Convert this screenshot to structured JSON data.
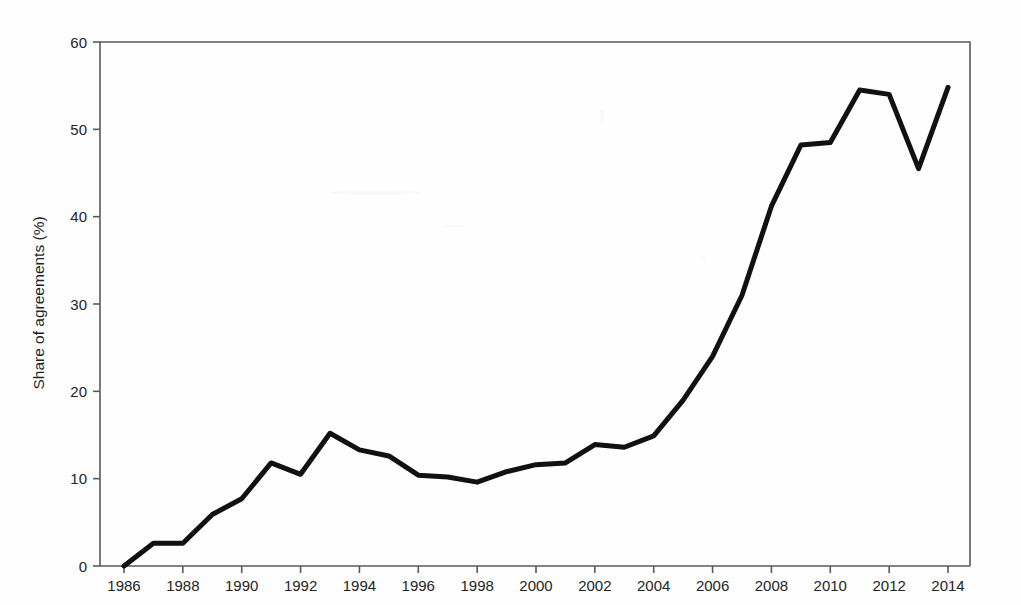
{
  "chart_data": {
    "type": "line",
    "title": "",
    "subtitle": "",
    "xlabel": "",
    "ylabel": "Share of agreements (%)",
    "xlim": [
      1985.5,
      2014.6
    ],
    "ylim": [
      0,
      60
    ],
    "xticks": [
      1986,
      1988,
      1990,
      1992,
      1994,
      1996,
      1998,
      2000,
      2002,
      2004,
      2006,
      2008,
      2010,
      2012,
      2014
    ],
    "xtick_labels": [
      "1986",
      "1988",
      "1990",
      "1992",
      "1994",
      "1996",
      "1998",
      "2000",
      "2002",
      "2004",
      "2006",
      "2008",
      "2010",
      "2012",
      "2014"
    ],
    "yticks": [
      0,
      10,
      20,
      30,
      40,
      50,
      60
    ],
    "ytick_labels": [
      "0",
      "10",
      "20",
      "30",
      "40",
      "50",
      "60"
    ],
    "grid": false,
    "legend": false,
    "legend_position": "none",
    "line_color": "#111111",
    "line_width": 5,
    "x": [
      1986,
      1987,
      1988,
      1989,
      1990,
      1991,
      1992,
      1993,
      1994,
      1995,
      1996,
      1997,
      1998,
      1999,
      2000,
      2001,
      2002,
      2003,
      2004,
      2005,
      2006,
      2007,
      2008,
      2009,
      2010,
      2011,
      2012,
      2013,
      2014
    ],
    "series": [
      {
        "name": "Share of agreements",
        "values": [
          0.0,
          2.6,
          2.6,
          5.9,
          7.7,
          11.8,
          10.5,
          15.2,
          13.3,
          12.6,
          10.4,
          10.2,
          9.6,
          10.8,
          11.6,
          11.8,
          13.9,
          13.6,
          14.9,
          19.0,
          24.0,
          31.0,
          41.2,
          48.2,
          48.5,
          54.5,
          54.0,
          45.5,
          54.8
        ]
      }
    ],
    "annotations": []
  },
  "axes": {
    "y_axis_title": "Share of agreements (%)"
  }
}
